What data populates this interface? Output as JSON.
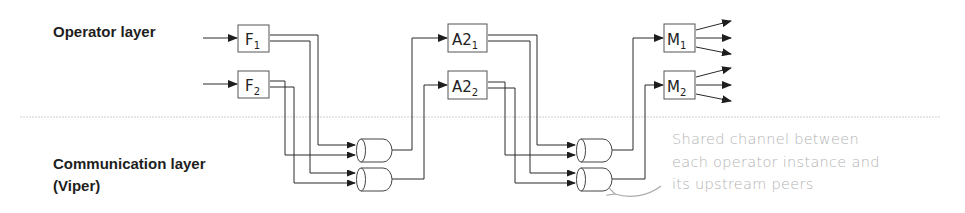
{
  "layers": {
    "operator_label": "Operator layer",
    "communication_label_line1": "Communication layer",
    "communication_label_line2": "(Viper)"
  },
  "operators": [
    {
      "name": "F",
      "sub": "1",
      "stage": "F"
    },
    {
      "name": "F",
      "sub": "2",
      "stage": "F"
    },
    {
      "name": "A2",
      "sub": "1",
      "stage": "A2"
    },
    {
      "name": "A2",
      "sub": "2",
      "stage": "A2"
    },
    {
      "name": "M",
      "sub": "1",
      "stage": "M"
    },
    {
      "name": "M",
      "sub": "2",
      "stage": "M"
    }
  ],
  "channels": [
    {
      "id": "channel-A2-1",
      "feeds": "A2_1"
    },
    {
      "id": "channel-A2-2",
      "feeds": "A2_2"
    },
    {
      "id": "channel-M-1",
      "feeds": "M_1"
    },
    {
      "id": "channel-M-2",
      "feeds": "M_2"
    }
  ],
  "annotation": {
    "line1": "Shared channel between",
    "line2": "each operator instance and",
    "line3": "its upstream peers"
  },
  "colors": {
    "line": "#2a2a2a",
    "box_border": "#555555",
    "separator": "#c8c8c8",
    "annotation_text": "#b3b3b3"
  }
}
